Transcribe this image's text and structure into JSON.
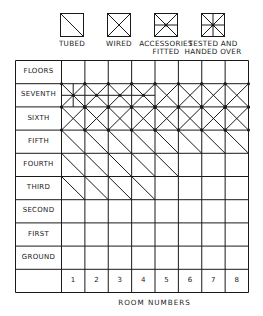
{
  "legend": [
    {
      "label": "TUBED",
      "label2": "",
      "symbol": "diagonal"
    },
    {
      "label": "WIRED",
      "label2": "",
      "symbol": "cross"
    },
    {
      "label": "ACCESSORIES",
      "label2": "FITTED",
      "symbol": "cross-horizontal"
    },
    {
      "label": "TESTED AND",
      "label2": "HANDED OVER",
      "symbol": "cross-horizontal-vertical"
    }
  ],
  "table": {
    "header": "FLOORS",
    "rows": [
      "SEVENTH",
      "SIXTH",
      "FIFTH",
      "FOURTH",
      "THIRD",
      "SECOND",
      "FIRST",
      "GROUND"
    ],
    "columns": [
      "1",
      "2",
      "3",
      "4",
      "5",
      "6",
      "7",
      "8"
    ],
    "axis_title": "ROOM NUMBERS",
    "status": {
      "SEVENTH": [
        "tested",
        "accessories",
        "accessories",
        "accessories",
        "wired",
        "wired",
        "wired",
        "wired"
      ],
      "SIXTH": [
        "wired",
        "wired",
        "wired",
        "wired",
        "wired",
        "wired",
        "wired",
        "wired"
      ],
      "FIFTH": [
        "tubed",
        "tubed",
        "tubed",
        "tubed",
        "tubed",
        "tubed",
        "tubed",
        "tubed"
      ],
      "FOURTH": [
        "tubed",
        "tubed",
        "tubed",
        "tubed",
        "tubed",
        "none",
        "none",
        "none"
      ],
      "THIRD": [
        "tubed",
        "tubed",
        "tubed",
        "tubed",
        "none",
        "none",
        "none",
        "none"
      ],
      "SECOND": [
        "none",
        "none",
        "none",
        "none",
        "none",
        "none",
        "none",
        "none"
      ],
      "FIRST": [
        "none",
        "none",
        "none",
        "none",
        "none",
        "none",
        "none",
        "none"
      ],
      "GROUND": [
        "none",
        "none",
        "none",
        "none",
        "none",
        "none",
        "none",
        "none"
      ]
    }
  },
  "colors": {
    "line": "#1a1a1a",
    "background": "#ffffff"
  }
}
